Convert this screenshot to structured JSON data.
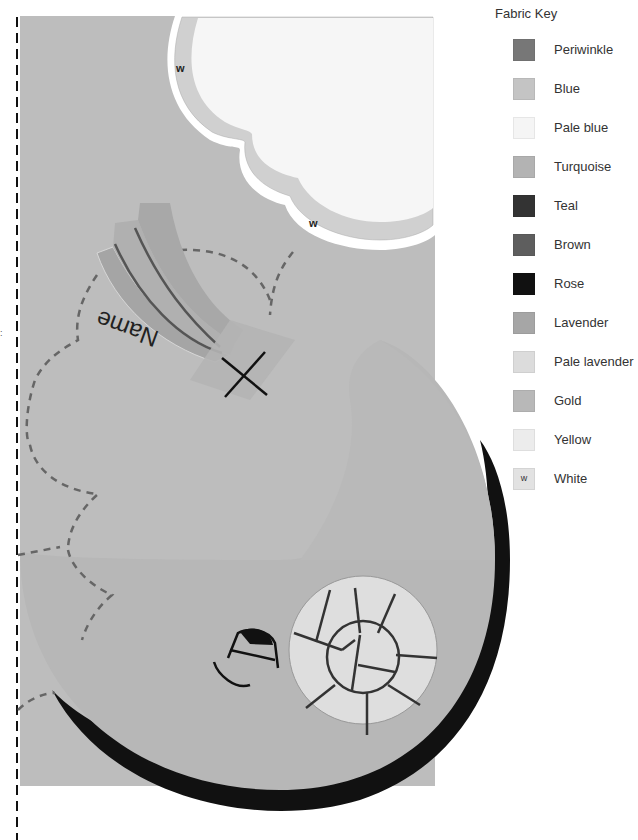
{
  "key": {
    "title": "Fabric Key",
    "items": [
      {
        "label": "Periwinkle",
        "color": "#777777",
        "mark": ""
      },
      {
        "label": "Blue",
        "color": "#c4c4c4",
        "mark": ""
      },
      {
        "label": "Pale blue",
        "color": "#f5f5f5",
        "mark": ""
      },
      {
        "label": "Turquoise",
        "color": "#b3b3b3",
        "mark": ""
      },
      {
        "label": "Teal",
        "color": "#333333",
        "mark": ""
      },
      {
        "label": "Brown",
        "color": "#5e5e5e",
        "mark": ""
      },
      {
        "label": "Rose",
        "color": "#111111",
        "mark": ""
      },
      {
        "label": "Lavender",
        "color": "#a6a6a6",
        "mark": ""
      },
      {
        "label": "Pale lavender",
        "color": "#dcdcdc",
        "mark": ""
      },
      {
        "label": "Gold",
        "color": "#b8b8b8",
        "mark": ""
      },
      {
        "label": "Yellow",
        "color": "#ececec",
        "mark": ""
      },
      {
        "label": "White",
        "color": "#e2e2e2",
        "mark": "w"
      }
    ]
  },
  "pattern": {
    "name_label": "Name",
    "white_marks": [
      "w",
      "w"
    ],
    "colors": {
      "background": "#bdbdbd",
      "cloud_border": "#d0d0d0",
      "cloud_fill": "#f6f6f6",
      "moon": "#b7b7b7",
      "moon_shadow": "#111111",
      "planet_fill": "#dedede",
      "ribbon_dark": "#a5a5a5",
      "ribbon_light": "#b0b0b0",
      "dash": "#666666"
    }
  }
}
